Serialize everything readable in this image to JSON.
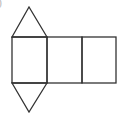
{
  "label": ")",
  "figure": {
    "type": "triangular-prism-net",
    "stroke": "#333333",
    "background": "#ffffff",
    "squares": [
      {
        "x": 12,
        "y": 37,
        "w": 35,
        "h": 46
      },
      {
        "x": 47,
        "y": 37,
        "w": 35,
        "h": 46
      },
      {
        "x": 82,
        "y": 37,
        "w": 35,
        "h": 46
      }
    ],
    "triangles": [
      {
        "points": "12,37 29,7 47,37"
      },
      {
        "points": "12,83 29,112 47,83"
      }
    ]
  }
}
